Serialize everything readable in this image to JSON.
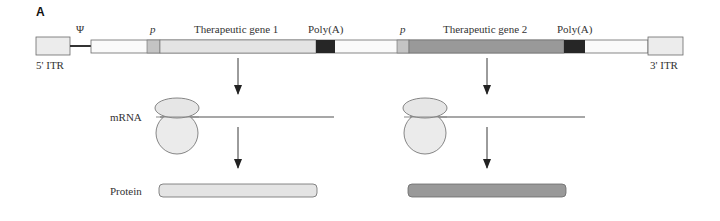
{
  "panel_label": "A",
  "construct": {
    "itr5_label": "5' ITR",
    "psi_label": "Ψ",
    "promoter1_label": "p",
    "gene1_label": "Therapeutic gene 1",
    "polya1_label": "Poly(A)",
    "promoter2_label": "p",
    "gene2_label": "Therapeutic gene 2",
    "polya2_label": "Poly(A)",
    "itr3_label": "3' ITR"
  },
  "rows": {
    "mrna_label": "mRNA",
    "protein_label": "Protein"
  },
  "colors": {
    "itr_fill": "#ececec",
    "backbone_fill": "#fafafa",
    "promoter_fill": "#c4c4c4",
    "gene1_fill": "#e4e4e4",
    "gene2_fill": "#999999",
    "polya_fill": "#262626",
    "outline": "#6a6a6a",
    "ribosome_fill": "#ebebeb",
    "mrna_line": "#8a8a8a",
    "arrow": "#222222"
  }
}
